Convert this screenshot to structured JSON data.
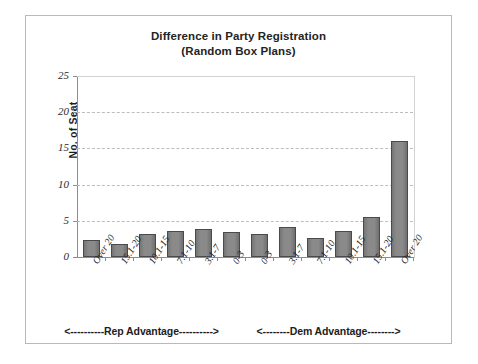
{
  "chart_data": {
    "type": "bar",
    "title": "Difference in Party Registration",
    "subtitle": "(Random Box Plans)",
    "xlabel": "",
    "ylabel": "No. of Seat",
    "ylim": [
      0,
      25
    ],
    "ytick_values": [
      0,
      5,
      10,
      15,
      20,
      25
    ],
    "ytick_labels": [
      "0",
      "5",
      "10",
      "15",
      "20",
      "25"
    ],
    "grid": true,
    "legend": "none",
    "categories": [
      "Over 20",
      "15.1-20",
      "10.1-15",
      "7.1-10",
      "3.1-7",
      "0-3",
      "0-3",
      "3.1-7",
      "7.1-10",
      "10.1-15",
      "15.1-20",
      "Over 20"
    ],
    "values": [
      2.4,
      1.8,
      3.2,
      3.6,
      3.9,
      3.5,
      3.2,
      4.1,
      2.6,
      3.6,
      5.5,
      16.0
    ],
    "bar_color": "#808080",
    "bar_edge_color": "#4a4a4a",
    "annotations": [
      "<----------Rep Advantage---------->",
      "<--------Dem Advantage-------->"
    ]
  },
  "title": {
    "line1": "Difference in Party Registration",
    "line2": "(Random Box Plans)"
  },
  "axes": {
    "y_title": "No. of Seat"
  }
}
